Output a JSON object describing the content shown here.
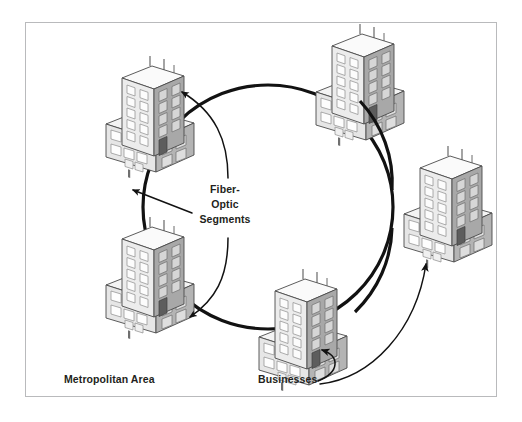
{
  "diagram": {
    "type": "network-ring-topology",
    "frame": {
      "x": 25,
      "y": 22,
      "width": 472,
      "height": 375,
      "border_color": "#b9babc"
    },
    "background_color": "#ffffff",
    "line_color": "#1a1a1a"
  },
  "labels": {
    "metropolitan_area": "Metropolitan Area",
    "businesses": "Businesses",
    "fiber_optic": {
      "line1": "Fiber-",
      "line2": "Optic",
      "line3": "Segments",
      "full": "Fiber-Optic Segments"
    }
  },
  "ring": {
    "name": "fiber-optic-ring",
    "center_x": 268,
    "center_y": 207,
    "radius_x": 125,
    "radius_y": 122,
    "stroke_width": 3.2,
    "stroke_color": "#121212"
  },
  "buildings": [
    {
      "id": "building-top",
      "name": "business-building-top",
      "x": 310,
      "y": 30,
      "scale": 1.0,
      "position": "top-center"
    },
    {
      "id": "building-upper-left",
      "name": "business-building-upper-left",
      "x": 100,
      "y": 62,
      "scale": 1.0,
      "position": "upper-left"
    },
    {
      "id": "building-lower-left",
      "name": "business-building-lower-left",
      "x": 100,
      "y": 223,
      "scale": 1.0,
      "position": "lower-left"
    },
    {
      "id": "building-right",
      "name": "business-building-right",
      "x": 398,
      "y": 152,
      "scale": 1.0,
      "position": "right"
    },
    {
      "id": "building-bottom",
      "name": "business-building-bottom",
      "x": 253,
      "y": 275,
      "scale": 1.0,
      "position": "bottom-center"
    }
  ],
  "leader_lines": [
    {
      "name": "fiber-leader-up",
      "from_label": "fiber_optic",
      "points_to": "ring-top-left-arc",
      "has_arrowhead": true
    },
    {
      "name": "fiber-leader-left",
      "from_label": "fiber_optic",
      "points_to": "ring-left-arc",
      "has_arrowhead": true
    },
    {
      "name": "fiber-leader-down",
      "from_label": "fiber_optic",
      "points_to": "ring-bottom-left-arc",
      "has_arrowhead": true
    },
    {
      "name": "businesses-leader-right",
      "from_label": "businesses",
      "points_to": "building-right",
      "has_arrowhead": true
    },
    {
      "name": "businesses-leader-bottom",
      "from_label": "businesses",
      "points_to": "building-bottom",
      "has_arrowhead": true
    }
  ],
  "palette": {
    "building_face_light": "#efefef",
    "building_face_mid": "#dcdcdc",
    "building_face_dark": "#9a9a9a",
    "building_roof": "#f7f7f7",
    "window_fill": "#fbfbfb",
    "window_stroke": "#8e8e8e",
    "outline": "#4a4a4a",
    "accent_dark_window": "#555555",
    "text": "#231f20"
  }
}
